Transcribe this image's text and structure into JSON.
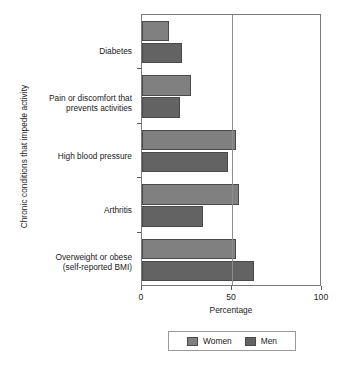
{
  "chart_data": {
    "type": "bar",
    "orientation": "horizontal",
    "grouped": true,
    "title": "",
    "xlabel": "Percentage",
    "ylabel": "Chronic conditions that impede activity",
    "categories": [
      "Diabetes",
      "Pain or discomfort that prevents activities",
      "High blood pressure",
      "Arthritis",
      "Overweight or obese (self-reported BMI)"
    ],
    "category_lines": [
      [
        "Diabetes"
      ],
      [
        "Pain or discomfort that",
        "prevents activities"
      ],
      [
        "High blood pressure"
      ],
      [
        "Arthritis"
      ],
      [
        "Overweight or obese",
        "(self-reported BMI)"
      ]
    ],
    "series": [
      {
        "name": "Women",
        "color": "#808080",
        "values": [
          15,
          27,
          52,
          54,
          52
        ]
      },
      {
        "name": "Men",
        "color": "#636363",
        "values": [
          22,
          21,
          48,
          34,
          62
        ]
      }
    ],
    "xlim": [
      0,
      100
    ],
    "xticks": [
      0,
      50,
      100
    ],
    "xticklabels": [
      "0",
      "50",
      "100"
    ],
    "gridlines_x": [
      50
    ],
    "grid": true,
    "legend_position": "bottom",
    "legend_entries": [
      "Women",
      "Men"
    ]
  }
}
